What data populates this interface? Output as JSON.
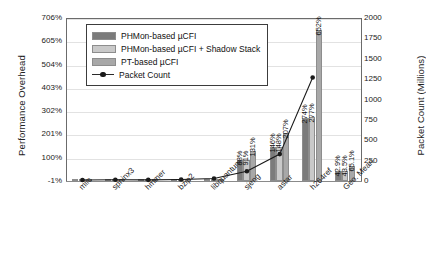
{
  "chart_data": {
    "type": "bar",
    "title": "",
    "xlabel": "",
    "ylabel": "Performance Overhead",
    "y2label": "Packet Count (Millions)",
    "grid": true,
    "legend_position": "top-left-inside",
    "categories": [
      "milc",
      "sphinx3",
      "hmmer",
      "bzip2",
      "libquantum",
      "sjeng",
      "astar",
      "h264ref",
      "Geo. Mean"
    ],
    "ylim": [
      -1,
      706
    ],
    "yticks": [
      "-1%",
      "100%",
      "201%",
      "302%",
      "403%",
      "504%",
      "605%",
      "706%"
    ],
    "ytick_values": [
      -1,
      100,
      201,
      302,
      403,
      504,
      605,
      706
    ],
    "y2lim": [
      0,
      2000
    ],
    "y2ticks": [
      "0",
      "250",
      "500",
      "750",
      "1000",
      "1250",
      "1500",
      "1750",
      "2000"
    ],
    "y2tick_values": [
      0,
      250,
      500,
      750,
      1000,
      1250,
      1500,
      1750,
      2000
    ],
    "series": [
      {
        "name": "PHMon-based  µCFI",
        "color": "#7b7b7b",
        "values": [
          0.5,
          1.0,
          0.8,
          1.2,
          2.0,
          88,
          146,
          274,
          42.9
        ],
        "labels": [
          "",
          "",
          "",
          "",
          "",
          "88%",
          "146%",
          "274%",
          "42.9%"
        ]
      },
      {
        "name": "PHMon-based  µCFI + Shadow Stack",
        "color": "#c9c9c9",
        "values": [
          0.7,
          1.3,
          1.1,
          1.6,
          2.6,
          91,
          148,
          277,
          43.5
        ],
        "labels": [
          "",
          "",
          "",
          "",
          "",
          "91%",
          "148%",
          "277%",
          "43.5%"
        ]
      },
      {
        "name": "PT-based  µCFI",
        "color": "#a8a8a8",
        "values": [
          1.0,
          2.0,
          1.6,
          2.4,
          4.0,
          131,
          207,
          652,
          65.1
        ],
        "labels": [
          "",
          "",
          "",
          "",
          "",
          "131%",
          "207%",
          "652%",
          "65.1%"
        ]
      }
    ],
    "line_series": {
      "name": "Packet Count",
      "color": "#1a1a1a",
      "axis": "right",
      "values": [
        12,
        15,
        14,
        18,
        30,
        120,
        330,
        1270,
        0
      ]
    }
  },
  "legend": {
    "items": [
      {
        "label": "PHMon-based  µCFI",
        "type": "bar",
        "swatch": "s0"
      },
      {
        "label": "PHMon-based  µCFI + Shadow Stack",
        "type": "bar",
        "swatch": "s1"
      },
      {
        "label": "PT-based  µCFI",
        "type": "bar",
        "swatch": "s2"
      },
      {
        "label": "Packet Count",
        "type": "line",
        "swatch": "line"
      }
    ]
  }
}
